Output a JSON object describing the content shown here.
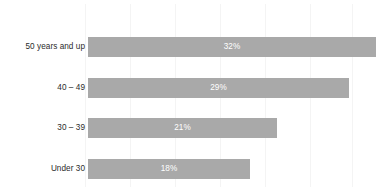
{
  "chart_data": {
    "type": "bar",
    "orientation": "horizontal",
    "title": "",
    "subtitle": "",
    "xlabel": "",
    "ylabel": "",
    "categories": [
      "50 years and up",
      "40 – 49",
      "30 – 39",
      "Under 30"
    ],
    "values": [
      32,
      29,
      21,
      18
    ],
    "value_labels": [
      "32%",
      "29%",
      "21%",
      "18%"
    ],
    "xlim": [
      0,
      35
    ],
    "grid": true,
    "grid_axis": "x",
    "grid_step": 5,
    "legend": null,
    "legend_position": "none",
    "bar_color": "#a9a9a9",
    "value_label_color": "#ffffff",
    "category_label_color": "#2b2b2b",
    "gridline_color": "#f4f4f4",
    "background_color": "#ffffff",
    "tick_labels_visible": false
  },
  "bars": [
    {
      "category": "50 years and up",
      "value": 32,
      "label": "32%"
    },
    {
      "category": "40 – 49",
      "value": 29,
      "label": "29%"
    },
    {
      "category": "30 – 39",
      "value": 21,
      "label": "21%"
    },
    {
      "category": "Under 30",
      "value": 18,
      "label": "18%"
    }
  ],
  "gridlines": [
    85,
    130,
    175,
    220,
    265,
    310,
    352
  ]
}
